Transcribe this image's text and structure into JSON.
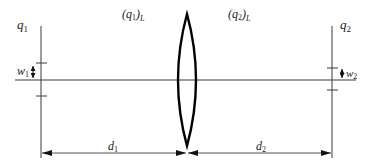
{
  "diagram": {
    "labels": {
      "q1": {
        "main": "q",
        "sub": "1"
      },
      "q2": {
        "main": "q",
        "sub": "2"
      },
      "q1L": {
        "open": "(q",
        "sub": "1",
        "close": ")",
        "subL": "L"
      },
      "q2L": {
        "open": "(q",
        "sub": "2",
        "close": ")",
        "subL": "L"
      },
      "w1": {
        "main": "w",
        "sub": "1"
      },
      "w2": {
        "main": "w",
        "sub": "2"
      },
      "d1": {
        "main": "d",
        "sub": "1"
      },
      "d2": {
        "main": "d",
        "sub": "2"
      }
    },
    "colors": {
      "line": "#3a3a3a",
      "lens": "#000000",
      "text": "#222222"
    }
  }
}
